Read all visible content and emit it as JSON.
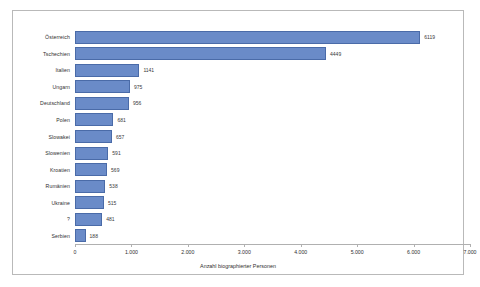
{
  "chart_data": {
    "type": "bar",
    "orientation": "horizontal",
    "title": "",
    "xlabel": "Anzahl biographierter Personen",
    "ylabel": "",
    "xlim": [
      0,
      7000
    ],
    "grid": false,
    "legend": "none",
    "bar_color": "#6a8bc8",
    "bar_border_color": "#4a6ba8",
    "tick_labels": [
      "0",
      "1.000",
      "2.000",
      "3.000",
      "4.000",
      "5.000",
      "6.000",
      "7.000"
    ],
    "tick_values": [
      0,
      1000,
      2000,
      3000,
      4000,
      5000,
      6000,
      7000
    ],
    "categories": [
      "Österreich",
      "Tschechien",
      "Italien",
      "Ungarn",
      "Deutschland",
      "Polen",
      "Slowakei",
      "Slowenien",
      "Kroatien",
      "Rumänien",
      "Ukraine",
      "?",
      "Serbien"
    ],
    "values": [
      6119,
      4449,
      1141,
      975,
      956,
      681,
      657,
      591,
      569,
      538,
      515,
      481,
      188
    ],
    "value_labels": [
      "6119",
      "4449",
      "1141",
      "975",
      "956",
      "681",
      "657",
      "591",
      "569",
      "538",
      "515",
      "481",
      "188"
    ]
  }
}
